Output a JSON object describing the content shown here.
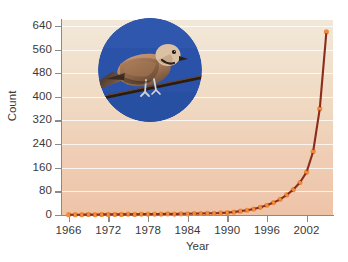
{
  "chart_data": {
    "type": "line",
    "title": "",
    "xlabel": "Year",
    "ylabel": "Count",
    "xlim": [
      1965,
      2006
    ],
    "ylim": [
      0,
      660
    ],
    "grid": true,
    "legend": "none",
    "line_color": "#8c2d1c",
    "marker_color": "#ef8c3e",
    "plot_bg_top": "#f2e8d8",
    "plot_bg_bottom": "#eec4a8",
    "xticks": [
      1966,
      1972,
      1978,
      1984,
      1990,
      1996,
      2002
    ],
    "xtick_labels": [
      "1966",
      "1972",
      "1978",
      "1984",
      "1990",
      "1996",
      "2002"
    ],
    "yticks": [
      0,
      80,
      160,
      240,
      320,
      400,
      480,
      560,
      640
    ],
    "ytick_labels": [
      "0",
      "80",
      "160",
      "240",
      "320",
      "400",
      "480",
      "560",
      "640"
    ],
    "x": [
      1966,
      1967,
      1968,
      1969,
      1970,
      1971,
      1972,
      1973,
      1974,
      1975,
      1976,
      1977,
      1978,
      1979,
      1980,
      1981,
      1982,
      1983,
      1984,
      1985,
      1986,
      1987,
      1988,
      1989,
      1990,
      1991,
      1992,
      1993,
      1994,
      1995,
      1996,
      1997,
      1998,
      1999,
      2000,
      2001,
      2002,
      2003,
      2004,
      2005
    ],
    "values": [
      1,
      1,
      1,
      2,
      1,
      2,
      2,
      2,
      2,
      3,
      2,
      3,
      3,
      3,
      3,
      4,
      3,
      4,
      4,
      5,
      5,
      6,
      6,
      7,
      8,
      10,
      13,
      16,
      20,
      26,
      33,
      42,
      53,
      68,
      86,
      110,
      145,
      215,
      360,
      620
    ],
    "series_name": "Count"
  },
  "inset": {
    "name": "eurasian-collared-dove-photo",
    "sky_color": "#2a52a8",
    "description": "Collared dove perched on a wire against blue sky"
  }
}
